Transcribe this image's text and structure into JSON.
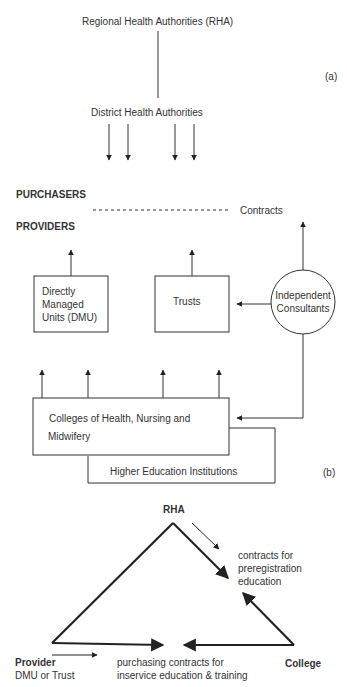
{
  "part_a": {
    "label": "(a)",
    "top_node": "Regional Health Authorities (RHA)",
    "district_node": "District Health Authorities",
    "purchasers_label": "PURCHASERS",
    "providers_label": "PROVIDERS",
    "contracts_label": "Contracts",
    "dmu_box": [
      "Directly",
      "Managed",
      "Units (DMU)"
    ],
    "trusts_box": "Trusts",
    "consultants_circle": [
      "Independent",
      "Consultants"
    ],
    "colleges_box": [
      "Colleges of Health, Nursing and",
      "Midwifery"
    ],
    "hei_box": "Higher Education Institutions"
  },
  "part_b": {
    "label": "(b)",
    "rha": "RHA",
    "preregistration_note": [
      "contracts for",
      "preregistration",
      "education"
    ],
    "provider_title": "Provider",
    "provider_subtitle": "DMU or Trust",
    "college": "College",
    "inservice_note": [
      "purchasing contracts for",
      "inservice education & training"
    ]
  },
  "colors": {
    "line": "#222222",
    "text": "#333333",
    "background": "#ffffff"
  }
}
